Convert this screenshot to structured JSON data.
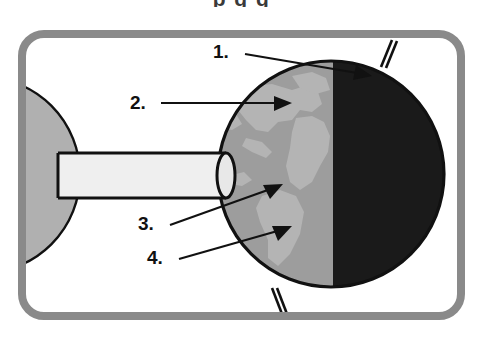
{
  "page": {
    "cropped_heading_text": "p              g           g",
    "background_color": "#ffffff"
  },
  "frame": {
    "name": "rounded-border-frame",
    "color": "#8a8a8a",
    "stroke_width": 8,
    "corner_radius": 26,
    "x": 18,
    "y": 30,
    "width": 447,
    "height": 290
  },
  "diagram": {
    "title_visible": false,
    "sun": {
      "label": "sun",
      "fill": "#b0b0b0",
      "outline": "#111111",
      "center_x": -18,
      "center_y": 175,
      "radius": 98
    },
    "light_beam": {
      "label": "light-beam-cylinder",
      "fill": "#efefef",
      "outline": "#111111",
      "x": 58,
      "y": 153,
      "width": 168,
      "height": 45
    },
    "earth": {
      "label": "earth-globe",
      "center_x": 331,
      "center_y": 174,
      "radius": 113,
      "outline": "#111111",
      "day_side_fill": "#9d9d9d",
      "night_side_fill": "#1a1a1a",
      "continent_fill": "#b4b4b4",
      "terminator_x": 333,
      "axis_color": "#111111"
    }
  },
  "callouts": [
    {
      "id": "callout-1",
      "label": "1.",
      "text_x": 213,
      "text_y": 58,
      "line_x1": 245,
      "line_y1": 54,
      "line_x2": 369,
      "line_y2": 75,
      "points_to": "north-pole-axis-region"
    },
    {
      "id": "callout-2",
      "label": "2.",
      "text_x": 130,
      "text_y": 109,
      "line_x1": 161,
      "line_y1": 103,
      "line_x2": 288,
      "line_y2": 103,
      "points_to": "northern-hemisphere-daylight"
    },
    {
      "id": "callout-3",
      "label": "3.",
      "text_x": 138,
      "text_y": 230,
      "line_x1": 170,
      "line_y1": 225,
      "line_x2": 279,
      "line_y2": 186,
      "points_to": "equator-day-region"
    },
    {
      "id": "callout-4",
      "label": "4.",
      "text_x": 147,
      "text_y": 264,
      "line_x1": 179,
      "line_y1": 259,
      "line_x2": 288,
      "line_y2": 228,
      "points_to": "southern-hemisphere-daylight"
    }
  ]
}
